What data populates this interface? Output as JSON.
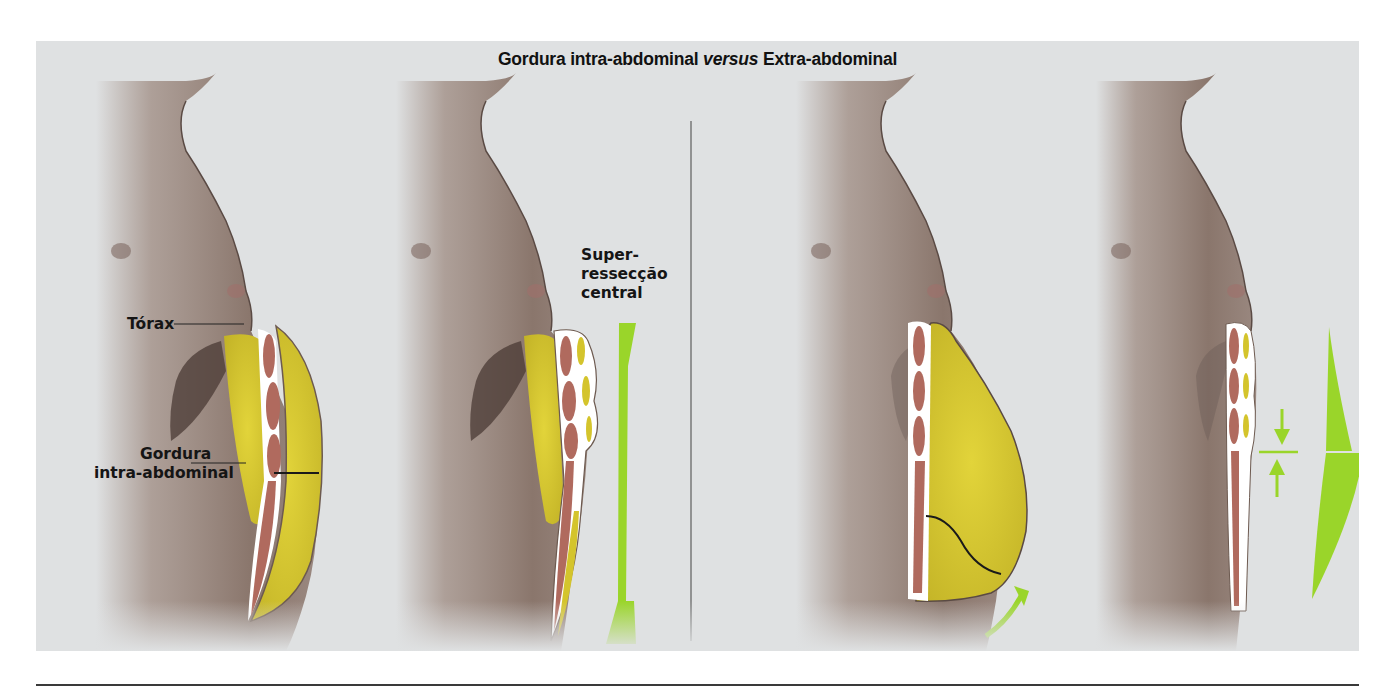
{
  "figure": {
    "title_part1": "Gordura intra-abdominal ",
    "title_italic": "versus",
    "title_part2": " Extra-abdominal",
    "background_color": "#dfe1e2",
    "accent_green": "#9ad52a",
    "fat_yellow": "#d4c42c",
    "muscle_color": "#b06a5e",
    "skin_color": "#8e7a70"
  },
  "panels": [
    {
      "id": "panel-1",
      "group": "intra-abdominal",
      "labels": [
        "Tórax",
        "Gordura intra-abdominal"
      ]
    },
    {
      "id": "panel-2",
      "group": "intra-abdominal",
      "labels": [
        "Super-ressecção central"
      ]
    },
    {
      "id": "panel-3",
      "group": "extra-abdominal",
      "labels": []
    },
    {
      "id": "panel-4",
      "group": "extra-abdominal",
      "labels": []
    }
  ],
  "labels": {
    "torax": "Tórax",
    "gordura_line1": "Gordura",
    "gordura_line2": "intra-abdominal",
    "super_line1": "Super-",
    "super_line2": "ressecção",
    "super_line3": "central"
  }
}
